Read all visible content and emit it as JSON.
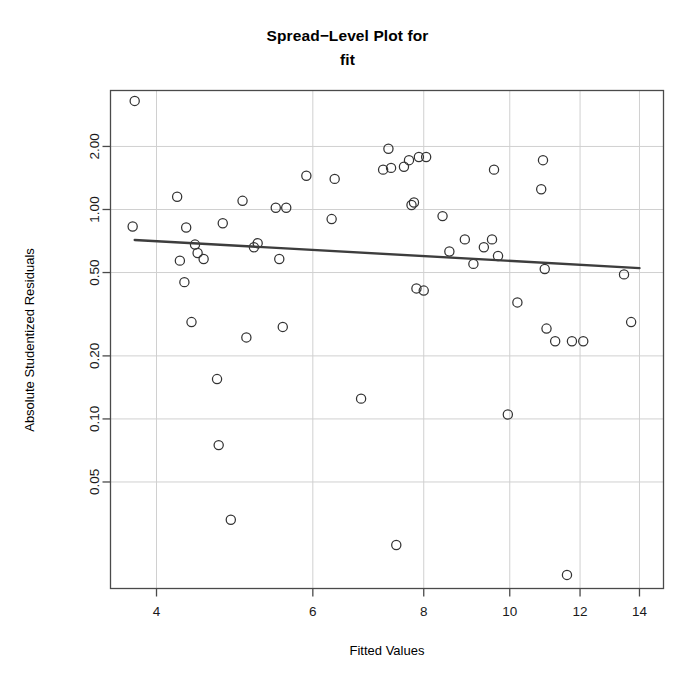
{
  "chart_data": {
    "type": "scatter",
    "title": "Spread−Level Plot for",
    "subtitle": "fit",
    "xlabel": "Fitted Values",
    "ylabel": "Absolute Studentized Residuals",
    "xscale": "log",
    "yscale": "log",
    "xlim": [
      3.55,
      14.9
    ],
    "ylim": [
      0.0155,
      3.7
    ],
    "grid": true,
    "xticks": [
      4,
      6,
      8,
      10,
      12,
      14
    ],
    "xtick_labels": [
      "4",
      "6",
      "8",
      "10",
      "12",
      "14"
    ],
    "yticks": [
      2.0,
      1.0,
      0.5,
      0.2,
      0.1,
      0.05
    ],
    "ytick_labels": [
      "2.00",
      "1.00",
      "0.50",
      "0.20",
      "0.10",
      "0.05"
    ],
    "point_marker": "open-circle",
    "point_color": "#333333",
    "line_color": "#3d3d3d",
    "x": [
      3.78,
      3.76,
      4.22,
      4.25,
      4.3,
      4.32,
      4.38,
      4.42,
      4.45,
      4.52,
      4.68,
      4.7,
      4.75,
      4.85,
      5.0,
      5.05,
      5.15,
      5.2,
      5.45,
      5.5,
      5.55,
      5.6,
      5.9,
      6.3,
      6.35,
      6.8,
      7.2,
      7.3,
      7.35,
      7.45,
      7.6,
      7.7,
      7.75,
      7.8,
      7.85,
      7.9,
      8.0,
      8.05,
      8.4,
      8.55,
      8.9,
      9.1,
      9.35,
      9.55,
      9.6,
      9.7,
      9.95,
      10.2,
      10.85,
      10.9,
      10.95,
      11.0,
      11.25,
      11.6,
      11.75,
      12.1,
      13.45,
      13.7
    ],
    "y": [
      3.3,
      0.83,
      1.15,
      0.57,
      0.45,
      0.82,
      0.29,
      0.68,
      0.62,
      0.58,
      0.155,
      0.075,
      0.86,
      0.033,
      1.1,
      0.245,
      0.66,
      0.69,
      1.02,
      0.58,
      0.275,
      1.02,
      1.45,
      0.9,
      1.4,
      0.125,
      1.55,
      1.95,
      1.58,
      0.025,
      1.6,
      1.72,
      1.05,
      1.08,
      0.42,
      1.78,
      0.41,
      1.78,
      0.93,
      0.63,
      0.72,
      0.55,
      0.66,
      0.72,
      1.55,
      0.6,
      0.105,
      0.36,
      1.25,
      1.72,
      0.52,
      0.27,
      0.235,
      0.018,
      0.235,
      0.235,
      0.49,
      0.29
    ],
    "trendline": {
      "x_start": 3.78,
      "y_start": 0.715,
      "x_end": 14.0,
      "y_end": 0.525
    }
  }
}
